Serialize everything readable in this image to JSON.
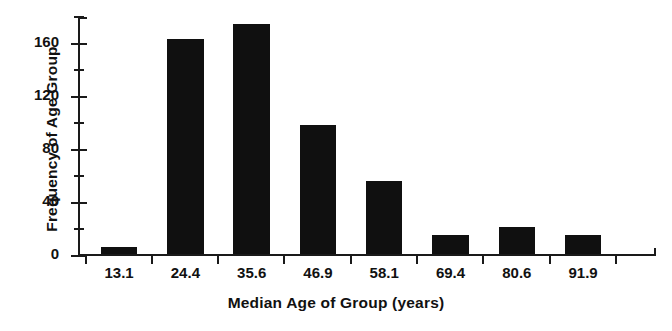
{
  "chart_data": {
    "type": "bar",
    "title": "",
    "subtitle": "",
    "xlabel": "Median Age of Group (years)",
    "ylabel": "Frequency of Age Group",
    "categories": [
      "13.1",
      "24.4",
      "35.6",
      "46.9",
      "58.1",
      "69.4",
      "80.6",
      "91.9"
    ],
    "values": [
      5,
      162,
      173,
      97,
      55,
      14,
      20,
      14
    ],
    "series": [
      {
        "name": "Frequency of Age Group",
        "values": [
          5,
          162,
          173,
          97,
          55,
          14,
          20,
          14
        ]
      }
    ],
    "ylim": [
      0,
      180
    ],
    "xlim": [
      0,
      8
    ],
    "y_major_ticks": [
      0,
      40,
      80,
      120,
      160
    ],
    "y_minor_ticks": [
      20,
      60,
      100,
      140,
      180
    ],
    "y_tick_labels": [
      "0",
      "40",
      "80",
      "120",
      "160"
    ],
    "x_tick_labels": [
      "13.1",
      "24.4",
      "35.6",
      "46.9",
      "58.1",
      "69.4",
      "80.6",
      "91.9"
    ],
    "grid": false,
    "legend": false,
    "legend_position": "none",
    "bar_color": "#101010",
    "axis_color": "#1a1a1a",
    "background_color": "#ffffff",
    "annotations": []
  },
  "axes": {
    "y_title": "Frequency of Age Group",
    "x_title": "Median Age of Group (years)",
    "y_labels": [
      {
        "text": "0",
        "value": 0
      },
      {
        "text": "40",
        "value": 40
      },
      {
        "text": "80",
        "value": 80
      },
      {
        "text": "120",
        "value": 120
      },
      {
        "text": "160",
        "value": 160
      }
    ],
    "y_minor_values": [
      20,
      60,
      100,
      140,
      180
    ],
    "x_labels": [
      {
        "text": "13.1",
        "index": 0
      },
      {
        "text": "24.4",
        "index": 1
      },
      {
        "text": "35.6",
        "index": 2
      },
      {
        "text": "46.9",
        "index": 3
      },
      {
        "text": "58.1",
        "index": 4
      },
      {
        "text": "69.4",
        "index": 5
      },
      {
        "text": "80.6",
        "index": 6
      },
      {
        "text": "91.9",
        "index": 7
      }
    ]
  }
}
